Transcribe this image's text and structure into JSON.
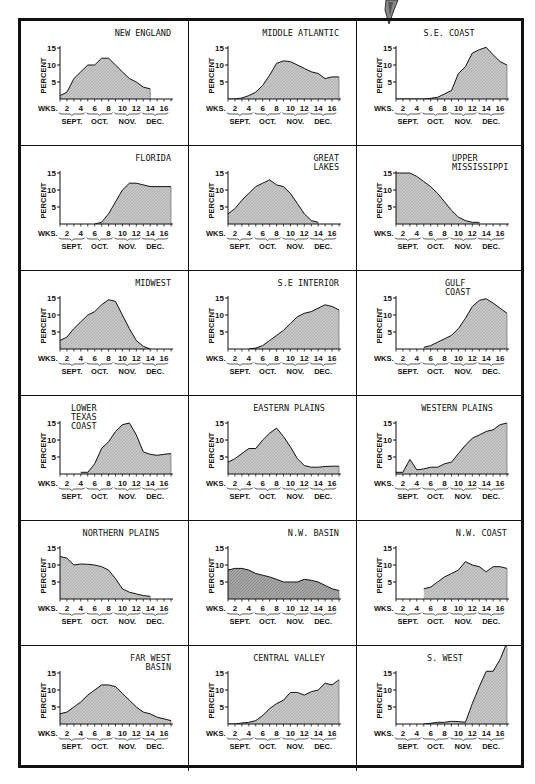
{
  "figure": {
    "ylabel": "PERCENT",
    "xlabel": "WKS.",
    "x_tick_labels": [
      "2",
      "4",
      "6",
      "8",
      "10",
      "12",
      "14",
      "16"
    ],
    "month_labels": [
      "SEPT.",
      "OCT.",
      "NOV.",
      "DEC."
    ],
    "y_tick_labels": [
      "5",
      "10",
      "15"
    ],
    "fill_color": "#c8c8c8",
    "line_color": "#222222"
  },
  "chart_data": [
    {
      "type": "area",
      "title": "NEW ENGLAND",
      "title_align": "right",
      "xlabel": "WKS.",
      "ylabel": "PERCENT",
      "ylim": [
        0,
        15
      ],
      "xlim": [
        1,
        17
      ],
      "x": [
        1,
        2,
        3,
        4,
        5,
        6,
        7,
        8,
        9,
        10,
        11,
        12,
        13,
        14
      ],
      "values": [
        1,
        2,
        6,
        8,
        10,
        10,
        12,
        12,
        10,
        8,
        6,
        5,
        3.5,
        3
      ]
    },
    {
      "type": "area",
      "title": "MIDDLE ATLANTIC",
      "title_align": "right",
      "xlabel": "WKS.",
      "ylabel": "PERCENT",
      "ylim": [
        0,
        15
      ],
      "xlim": [
        1,
        17
      ],
      "x": [
        1,
        2,
        3,
        4,
        5,
        6,
        7,
        8,
        9,
        10,
        11,
        12,
        13,
        14,
        15,
        16,
        17
      ],
      "values": [
        0,
        0,
        0.3,
        1,
        2,
        4,
        7,
        10.5,
        11.2,
        11,
        10,
        9,
        8,
        7.5,
        6,
        6.5,
        6.5
      ]
    },
    {
      "type": "area",
      "title": "S.E. COAST",
      "title_align": "center",
      "xlabel": "WKS.",
      "ylabel": "PERCENT",
      "ylim": [
        0,
        15
      ],
      "xlim": [
        1,
        17
      ],
      "x": [
        1,
        2,
        3,
        4,
        5,
        6,
        7,
        8,
        9,
        10,
        11,
        12,
        13,
        14,
        15,
        16,
        17
      ],
      "values": [
        0,
        0,
        0,
        0,
        0,
        0.2,
        0.5,
        1.5,
        2.5,
        7.5,
        9.5,
        13.5,
        14.5,
        15.2,
        13,
        11,
        10
      ]
    },
    {
      "type": "area",
      "title": "FLORIDA",
      "title_align": "right",
      "xlabel": "WKS.",
      "ylabel": "PERCENT",
      "ylim": [
        0,
        15
      ],
      "xlim": [
        1,
        17
      ],
      "x": [
        6,
        7,
        8,
        9,
        10,
        11,
        12,
        13,
        14,
        15,
        16,
        17
      ],
      "values": [
        0,
        0.5,
        3,
        6.5,
        10,
        12,
        12,
        11.5,
        11,
        11,
        11,
        11
      ]
    },
    {
      "type": "area",
      "title": "GREAT LAKES",
      "title_align": "right",
      "xlabel": "WKS.",
      "ylabel": "PERCENT",
      "ylim": [
        0,
        15
      ],
      "xlim": [
        1,
        17
      ],
      "x": [
        1,
        2,
        3,
        4,
        5,
        6,
        7,
        8,
        9,
        10,
        11,
        12,
        13,
        14
      ],
      "values": [
        3,
        4.5,
        7,
        9,
        11,
        12,
        13,
        11.5,
        11,
        9,
        6,
        3,
        1,
        0.5
      ]
    },
    {
      "type": "area",
      "title": "UPPER MISSISSIPPI",
      "title_align": "right",
      "xlabel": "WKS.",
      "ylabel": "PERCENT",
      "ylim": [
        0,
        15
      ],
      "xlim": [
        1,
        17
      ],
      "x": [
        1,
        2,
        3,
        4,
        5,
        6,
        7,
        8,
        9,
        10,
        11,
        12,
        13
      ],
      "values": [
        15,
        15,
        15,
        14,
        12.5,
        11,
        9,
        6.5,
        4,
        2,
        1,
        0.5,
        0.5
      ]
    },
    {
      "type": "area",
      "title": "MIDWEST",
      "title_align": "right",
      "xlabel": "WKS.",
      "ylabel": "PERCENT",
      "ylim": [
        0,
        15
      ],
      "xlim": [
        1,
        17
      ],
      "x": [
        1,
        2,
        3,
        4,
        5,
        6,
        7,
        8,
        9,
        10,
        11,
        12,
        13,
        14
      ],
      "values": [
        2.5,
        3.5,
        6,
        8,
        10,
        11,
        13,
        14.5,
        14,
        10,
        6,
        2.5,
        0.8,
        0
      ],
      "axis_note": "tail ends at week 14"
    },
    {
      "type": "area",
      "title": "S.E INTERIOR",
      "title_align": "right",
      "xlabel": "WKS.",
      "ylabel": "PERCENT",
      "ylim": [
        0,
        15
      ],
      "xlim": [
        1,
        17
      ],
      "x": [
        4,
        5,
        6,
        7,
        8,
        9,
        10,
        11,
        12,
        13,
        14,
        15,
        16,
        17
      ],
      "values": [
        0,
        0.3,
        1,
        2.5,
        4,
        5.5,
        7.5,
        9.5,
        10.5,
        11,
        12,
        13,
        12.5,
        11.5
      ]
    },
    {
      "type": "area",
      "title": "GULF COAST",
      "title_align": "center",
      "xlabel": "WKS.",
      "ylabel": "PERCENT",
      "ylim": [
        0,
        15
      ],
      "xlim": [
        1,
        17
      ],
      "x": [
        5,
        6,
        7,
        8,
        9,
        10,
        11,
        12,
        13,
        14,
        15,
        16,
        17
      ],
      "values": [
        0.5,
        1,
        2,
        3,
        4,
        6,
        9,
        12.5,
        14.3,
        14.8,
        13.5,
        12,
        10.5
      ]
    },
    {
      "type": "area",
      "title": "LOWER TEXAS COAST",
      "title_align": "left",
      "xlabel": "WKS.",
      "ylabel": "PERCENT",
      "ylim": [
        0,
        15
      ],
      "xlim": [
        1,
        17
      ],
      "x": [
        4,
        5,
        6,
        7,
        8,
        9,
        10,
        11,
        12,
        13,
        14,
        15,
        16,
        17
      ],
      "values": [
        0.5,
        0.5,
        3,
        7.5,
        9.5,
        12.5,
        14.5,
        15,
        11.5,
        6.5,
        5.8,
        5.5,
        5.8,
        6
      ]
    },
    {
      "type": "area",
      "title": "EASTERN PLAINS",
      "title_align": "center",
      "xlabel": "WKS.",
      "ylabel": "PERCENT",
      "ylim": [
        0,
        15
      ],
      "xlim": [
        1,
        17
      ],
      "x": [
        1,
        2,
        3,
        4,
        5,
        6,
        7,
        8,
        9,
        10,
        11,
        12,
        13,
        14,
        15,
        16,
        17
      ],
      "values": [
        3.5,
        4.5,
        6,
        7.5,
        7.5,
        10,
        12,
        13.5,
        11,
        8,
        4.5,
        2.5,
        2,
        2,
        2.2,
        2.3,
        2.3
      ]
    },
    {
      "type": "area",
      "title": "WESTERN PLAINS",
      "title_align": "center",
      "xlabel": "WKS.",
      "ylabel": "PERCENT",
      "ylim": [
        0,
        15
      ],
      "xlim": [
        1,
        17
      ],
      "x": [
        1,
        2,
        3,
        4,
        5,
        6,
        7,
        8,
        9,
        10,
        11,
        12,
        13,
        14,
        15,
        16,
        17
      ],
      "values": [
        0.5,
        0.5,
        4.3,
        1.2,
        1.5,
        2,
        2,
        3,
        3.5,
        6,
        8.5,
        10.5,
        11.5,
        12.5,
        13,
        14.5,
        15
      ]
    },
    {
      "type": "area",
      "title": "NORTHERN PLAINS",
      "title_align": "center",
      "xlabel": "WKS.",
      "ylabel": "PERCENT",
      "ylim": [
        0,
        15
      ],
      "xlim": [
        1,
        17
      ],
      "x": [
        1,
        2,
        3,
        4,
        5,
        6,
        7,
        8,
        9,
        10,
        11,
        12,
        13,
        14
      ],
      "values": [
        12.5,
        12,
        10,
        10.3,
        10.2,
        10,
        9.5,
        8.5,
        6,
        3,
        2,
        1.5,
        1,
        0.8
      ]
    },
    {
      "type": "area",
      "title": "N.W. BASIN",
      "title_align": "right",
      "xlabel": "WKS.",
      "ylabel": "PERCENT",
      "ylim": [
        0,
        15
      ],
      "xlim": [
        1,
        17
      ],
      "x": [
        1,
        2,
        3,
        4,
        5,
        6,
        7,
        8,
        9,
        10,
        11,
        12,
        13,
        14,
        15,
        16,
        17
      ],
      "values": [
        8.5,
        9,
        9,
        8.5,
        7.5,
        7,
        6.5,
        5.8,
        5,
        5,
        5,
        5.8,
        5.5,
        5,
        4,
        3,
        2.5
      ]
    },
    {
      "type": "area",
      "title": "N.W. COAST",
      "title_align": "right",
      "xlabel": "WKS.",
      "ylabel": "PERCENT",
      "ylim": [
        0,
        15
      ],
      "xlim": [
        1,
        17
      ],
      "x": [
        5,
        6,
        7,
        8,
        9,
        10,
        11,
        12,
        13,
        14,
        15,
        16,
        17
      ],
      "values": [
        3,
        3.5,
        5,
        6.5,
        7.5,
        8.5,
        11,
        10,
        9.5,
        8,
        9.5,
        9.5,
        9
      ]
    },
    {
      "type": "area",
      "title": "FAR WEST BASIN",
      "title_align": "right",
      "xlabel": "WKS.",
      "ylabel": "PERCENT",
      "ylim": [
        0,
        15
      ],
      "xlim": [
        1,
        17
      ],
      "x": [
        1,
        2,
        3,
        4,
        5,
        6,
        7,
        8,
        9,
        10,
        11,
        12,
        13,
        14,
        15,
        16,
        17
      ],
      "values": [
        3,
        3.5,
        5,
        6.5,
        8.5,
        10,
        11.5,
        11.5,
        11,
        9,
        7,
        5,
        3.5,
        3,
        2,
        1.5,
        1
      ]
    },
    {
      "type": "area",
      "title": "CENTRAL VALLEY",
      "title_align": "center",
      "xlabel": "WKS.",
      "ylabel": "PERCENT",
      "ylim": [
        0,
        15
      ],
      "xlim": [
        1,
        17
      ],
      "x": [
        1,
        2,
        3,
        4,
        5,
        6,
        7,
        8,
        9,
        10,
        11,
        12,
        13,
        14,
        15,
        16,
        17
      ],
      "values": [
        0,
        0,
        0.3,
        0.5,
        1,
        2.5,
        4.5,
        6,
        7,
        9.3,
        9.3,
        8.5,
        9.5,
        10,
        12,
        11.5,
        13
      ]
    },
    {
      "type": "area",
      "title": "S. WEST",
      "title_align": "center",
      "xlabel": "WKS.",
      "ylabel": "PERCENT",
      "ylim": [
        0,
        15
      ],
      "xlim": [
        1,
        17
      ],
      "x": [
        5,
        6,
        7,
        8,
        9,
        10,
        11,
        12,
        13,
        14,
        15,
        16,
        17
      ],
      "values": [
        0,
        0.2,
        0.5,
        0.5,
        0.8,
        0.7,
        0.5,
        6,
        11,
        15.5,
        15.5,
        19,
        24
      ],
      "note": "values exceed the 15% axis and run off the top of the panel"
    }
  ]
}
